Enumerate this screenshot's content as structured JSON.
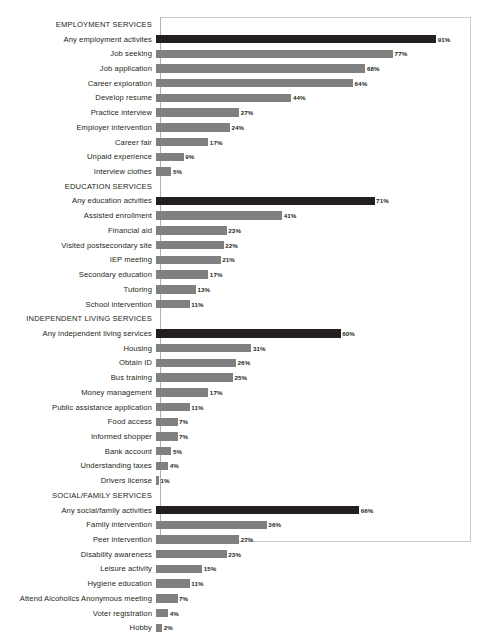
{
  "chart_data": {
    "type": "bar",
    "orientation": "horizontal",
    "title": "",
    "subtitle": "",
    "xlabel": "",
    "ylabel": "",
    "xlim": [
      0,
      101
    ],
    "grid": false,
    "legend": null,
    "value_suffix": "%",
    "colors": {
      "bar": "#808080",
      "highlight_bar": "#231f20",
      "frame": "#c9c9c9",
      "text": "#231f20",
      "background": "#ffffff"
    },
    "sections": [
      {
        "header": "EMPLOYMENT SERVICES",
        "rows": [
          {
            "label": "Any employment activites",
            "value": 91,
            "value_label": "91%",
            "highlight": true
          },
          {
            "label": "Job seeking",
            "value": 77,
            "value_label": "77%",
            "highlight": false
          },
          {
            "label": "Job application",
            "value": 68,
            "value_label": "68%",
            "highlight": false
          },
          {
            "label": "Career exploration",
            "value": 64,
            "value_label": "64%",
            "highlight": false
          },
          {
            "label": "Develop resume",
            "value": 44,
            "value_label": "44%",
            "highlight": false
          },
          {
            "label": "Practice interview",
            "value": 27,
            "value_label": "27%",
            "highlight": false
          },
          {
            "label": "Employer intervention",
            "value": 24,
            "value_label": "24%",
            "highlight": false
          },
          {
            "label": "Career fair",
            "value": 17,
            "value_label": "17%",
            "highlight": false
          },
          {
            "label": "Unpaid experience",
            "value": 9,
            "value_label": "9%",
            "highlight": false
          },
          {
            "label": "Interview clothes",
            "value": 5,
            "value_label": "5%",
            "highlight": false
          }
        ]
      },
      {
        "header": "EDUCATION SERVICES",
        "rows": [
          {
            "label": "Any education actvities",
            "value": 71,
            "value_label": "71%",
            "highlight": true
          },
          {
            "label": "Assisted enrollment",
            "value": 41,
            "value_label": "41%",
            "highlight": false
          },
          {
            "label": "Financial aid",
            "value": 23,
            "value_label": "23%",
            "highlight": false
          },
          {
            "label": "Visited postsecondary site",
            "value": 22,
            "value_label": "22%",
            "highlight": false
          },
          {
            "label": "IEP meeting",
            "value": 21,
            "value_label": "21%",
            "highlight": false
          },
          {
            "label": "Secondary education",
            "value": 17,
            "value_label": "17%",
            "highlight": false
          },
          {
            "label": "Tutoring",
            "value": 13,
            "value_label": "13%",
            "highlight": false
          },
          {
            "label": "School intervention",
            "value": 11,
            "value_label": "11%",
            "highlight": false
          }
        ]
      },
      {
        "header": "INDEPENDENT LIVING SERVICES",
        "rows": [
          {
            "label": "Any independent living services",
            "value": 60,
            "value_label": "60%",
            "highlight": true
          },
          {
            "label": "Housing",
            "value": 31,
            "value_label": "31%",
            "highlight": false
          },
          {
            "label": "Obtain ID",
            "value": 26,
            "value_label": "26%",
            "highlight": false
          },
          {
            "label": "Bus training",
            "value": 25,
            "value_label": "25%",
            "highlight": false
          },
          {
            "label": "Money management",
            "value": 17,
            "value_label": "17%",
            "highlight": false
          },
          {
            "label": "Public assistance application",
            "value": 11,
            "value_label": "11%",
            "highlight": false
          },
          {
            "label": "Food access",
            "value": 7,
            "value_label": "7%",
            "highlight": false
          },
          {
            "label": "Informed shopper",
            "value": 7,
            "value_label": "7%",
            "highlight": false
          },
          {
            "label": "Bank account",
            "value": 5,
            "value_label": "5%",
            "highlight": false
          },
          {
            "label": "Understanding taxes",
            "value": 4,
            "value_label": "4%",
            "highlight": false
          },
          {
            "label": "Drivers license",
            "value": 1,
            "value_label": "1%",
            "highlight": false
          }
        ]
      },
      {
        "header": "SOCIAL/FAMILY SERVICES",
        "rows": [
          {
            "label": "Any social/family activities",
            "value": 66,
            "value_label": "66%",
            "highlight": true
          },
          {
            "label": "Family intervention",
            "value": 36,
            "value_label": "36%",
            "highlight": false
          },
          {
            "label": "Peer intervention",
            "value": 27,
            "value_label": "27%",
            "highlight": false
          },
          {
            "label": "Disability awareness",
            "value": 23,
            "value_label": "23%",
            "highlight": false
          },
          {
            "label": "Leisure activity",
            "value": 15,
            "value_label": "15%",
            "highlight": false
          },
          {
            "label": "Hygiene education",
            "value": 11,
            "value_label": "11%",
            "highlight": false
          },
          {
            "label": "Attend Alcoholics Anonymous meeting",
            "value": 7,
            "value_label": "7%",
            "highlight": false
          },
          {
            "label": "Voter registration",
            "value": 4,
            "value_label": "4%",
            "highlight": false
          },
          {
            "label": "Hobby",
            "value": 2,
            "value_label": "2%",
            "highlight": false
          }
        ]
      }
    ]
  }
}
